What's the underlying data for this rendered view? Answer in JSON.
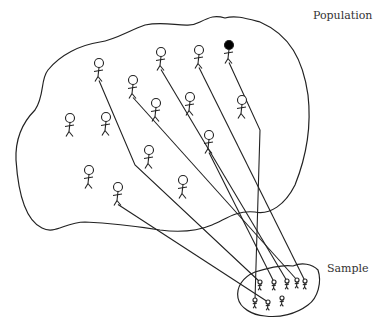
{
  "diagram": {
    "population_label": "Population",
    "sample_label": "Sample",
    "colors": {
      "stroke": "#222222",
      "highlight": "#000000"
    },
    "population_people": [
      {
        "id": "p1",
        "pos": [
          99,
          63
        ],
        "sampled": true,
        "highlight": false,
        "bend": [
          135,
          165
        ],
        "target": 0
      },
      {
        "id": "p2",
        "pos": [
          161,
          52
        ],
        "sampled": true,
        "highlight": false,
        "bend": null,
        "target": 2
      },
      {
        "id": "p3",
        "pos": [
          199,
          50
        ],
        "sampled": true,
        "highlight": false,
        "bend": null,
        "target": 4
      },
      {
        "id": "p4",
        "pos": [
          229,
          45
        ],
        "sampled": true,
        "highlight": true,
        "bend": [
          260,
          130
        ],
        "target": 5
      },
      {
        "id": "p5",
        "pos": [
          133,
          80
        ],
        "sampled": true,
        "highlight": false,
        "bend": null,
        "target": 3
      },
      {
        "id": "p6",
        "pos": [
          70,
          118
        ],
        "sampled": false,
        "highlight": false
      },
      {
        "id": "p7",
        "pos": [
          106,
          117
        ],
        "sampled": false,
        "highlight": false
      },
      {
        "id": "p8",
        "pos": [
          156,
          103
        ],
        "sampled": false,
        "highlight": false
      },
      {
        "id": "p9",
        "pos": [
          190,
          97
        ],
        "sampled": false,
        "highlight": false
      },
      {
        "id": "p10",
        "pos": [
          242,
          100
        ],
        "sampled": false,
        "highlight": false
      },
      {
        "id": "p11",
        "pos": [
          209,
          135
        ],
        "sampled": true,
        "highlight": false,
        "bend": null,
        "target": 1
      },
      {
        "id": "p12",
        "pos": [
          149,
          150
        ],
        "sampled": false,
        "highlight": false
      },
      {
        "id": "p13",
        "pos": [
          89,
          170
        ],
        "sampled": false,
        "highlight": false
      },
      {
        "id": "p14",
        "pos": [
          183,
          180
        ],
        "sampled": false,
        "highlight": false
      },
      {
        "id": "p15",
        "pos": [
          118,
          187
        ],
        "sampled": true,
        "highlight": false,
        "bend": null,
        "target": 6
      }
    ],
    "sample_people": [
      {
        "pos": [
          260,
          282
        ]
      },
      {
        "pos": [
          274,
          282
        ]
      },
      {
        "pos": [
          287,
          281
        ]
      },
      {
        "pos": [
          297,
          280
        ]
      },
      {
        "pos": [
          305,
          281
        ]
      },
      {
        "pos": [
          255,
          300
        ]
      },
      {
        "pos": [
          268,
          302
        ]
      },
      {
        "pos": [
          282,
          298
        ]
      }
    ]
  }
}
